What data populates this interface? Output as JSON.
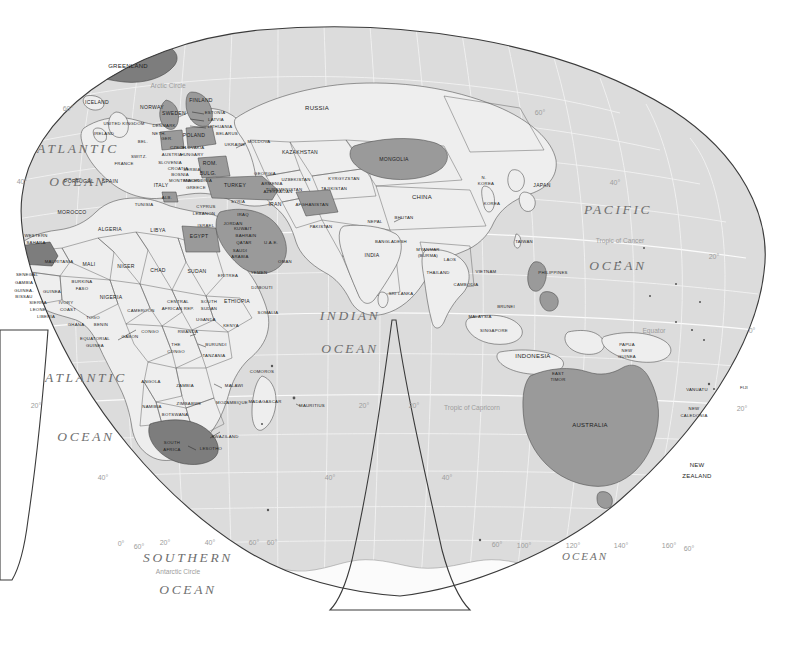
{
  "map": {
    "title": "World Map — Eastern Hemisphere (interrupted projection)",
    "projection": "interrupted-homolosine",
    "colors": {
      "background": "#ffffff",
      "ocean": "#dcdcdc",
      "land": "#eeeeee",
      "highlight_light": "#b9b9b9",
      "highlight_mid": "#9a9a9a",
      "highlight_dark": "#7d7d7d",
      "antarctica": "#fbfbfb",
      "border": "#555555",
      "graticule": "#f4f4f4",
      "frame": "#3a3a3a",
      "label_text": "#1d1d1d",
      "ocean_text": "#6f6f6f",
      "graticule_text": "#9c9c9c"
    }
  },
  "oceans": [
    {
      "id": "atlantic-north",
      "line1": "ATLANTIC",
      "line2": "OCEAN",
      "x": 78,
      "y1": 150,
      "y2": 183
    },
    {
      "id": "atlantic-south",
      "line1": "ATLANTIC",
      "line2": "OCEAN",
      "x": 86,
      "y1": 379,
      "y2": 438
    },
    {
      "id": "indian",
      "line1": "INDIAN",
      "line2": "OCEAN",
      "x": 350,
      "y1": 317,
      "y2": 350
    },
    {
      "id": "pacific",
      "line1": "PACIFIC",
      "line2": "OCEAN",
      "x": 618,
      "y1": 211,
      "y2": 267
    },
    {
      "id": "southern",
      "line1": "SOUTHERN",
      "line2": "OCEAN",
      "x": 188,
      "y1": 559,
      "y2": 591
    },
    {
      "id": "southern-east",
      "line1": "OCEAN",
      "line2": "",
      "x": 585,
      "y1": 557,
      "y2": 0
    }
  ],
  "reference_lines": [
    {
      "id": "arctic-circle",
      "label": "Arctic Circle",
      "x": 168,
      "y": 86
    },
    {
      "id": "tropic-of-cancer",
      "label": "Tropic of Cancer",
      "x": 620,
      "y": 241
    },
    {
      "id": "equator",
      "label": "Equator",
      "x": 654,
      "y": 331
    },
    {
      "id": "tropic-of-capricorn",
      "label": "Tropic of Capricorn",
      "x": 472,
      "y": 408
    },
    {
      "id": "antarctic-circle",
      "label": "Antarctic Circle",
      "x": 178,
      "y": 572
    }
  ],
  "graticule_labels": [
    {
      "id": "lat-60-nw",
      "label": "60°",
      "x": 68,
      "y": 109
    },
    {
      "id": "lat-40-nw",
      "label": "40°",
      "x": 22,
      "y": 182
    },
    {
      "id": "lat-60-ne",
      "label": "60°",
      "x": 540,
      "y": 113
    },
    {
      "id": "lat-40-ne",
      "label": "40°",
      "x": 615,
      "y": 183
    },
    {
      "id": "lat-20-ne",
      "label": "20°",
      "x": 714,
      "y": 257
    },
    {
      "id": "lat-0-e",
      "label": "0°",
      "x": 752,
      "y": 331
    },
    {
      "id": "lat-20-se",
      "label": "20°",
      "x": 742,
      "y": 409
    },
    {
      "id": "lat-20-sw",
      "label": "20°",
      "x": 36,
      "y": 406
    },
    {
      "id": "lat-20-gl",
      "label": "20°",
      "x": 364,
      "y": 406
    },
    {
      "id": "lat-20-gr",
      "label": "20°",
      "x": 414,
      "y": 406
    },
    {
      "id": "lat-40-sw",
      "label": "40°",
      "x": 103,
      "y": 478
    },
    {
      "id": "lat-40-gl",
      "label": "40°",
      "x": 330,
      "y": 478
    },
    {
      "id": "lat-40-gr",
      "label": "40°",
      "x": 447,
      "y": 478
    },
    {
      "id": "lat-60-sw",
      "label": "60°",
      "x": 139,
      "y": 547
    },
    {
      "id": "lat-60-gl",
      "label": "60°",
      "x": 272,
      "y": 543
    },
    {
      "id": "lat-60-gr",
      "label": "60°",
      "x": 497,
      "y": 545
    },
    {
      "id": "lat-60-sse",
      "label": "60°",
      "x": 689,
      "y": 549
    },
    {
      "id": "lon-0",
      "label": "0°",
      "x": 121,
      "y": 544
    },
    {
      "id": "lon-20e",
      "label": "20°",
      "x": 165,
      "y": 543
    },
    {
      "id": "lon-40e",
      "label": "40°",
      "x": 210,
      "y": 543
    },
    {
      "id": "lon-60e",
      "label": "60°",
      "x": 254,
      "y": 543
    },
    {
      "id": "lon-100e",
      "label": "100°",
      "x": 524,
      "y": 546
    },
    {
      "id": "lon-120e",
      "label": "120°",
      "x": 573,
      "y": 546
    },
    {
      "id": "lon-140e",
      "label": "140°",
      "x": 621,
      "y": 546
    },
    {
      "id": "lon-160e",
      "label": "160°",
      "x": 669,
      "y": 546
    }
  ],
  "countries": [
    {
      "name": "GREENLAND",
      "x": 128,
      "y": 66,
      "cls": "md"
    },
    {
      "name": "ICELAND",
      "x": 97,
      "y": 103
    },
    {
      "name": "NORWAY",
      "x": 152,
      "y": 108
    },
    {
      "name": "SWEDEN",
      "x": 174,
      "y": 114
    },
    {
      "name": "FINLAND",
      "x": 201,
      "y": 101
    },
    {
      "name": "ESTONIA",
      "x": 215,
      "y": 113,
      "cls": "sm"
    },
    {
      "name": "LATVIA",
      "x": 216,
      "y": 120,
      "cls": "sm"
    },
    {
      "name": "LITHUANIA",
      "x": 220,
      "y": 127,
      "cls": "sm"
    },
    {
      "name": "UNITED KINGDOM",
      "x": 124,
      "y": 124,
      "cls": "sm"
    },
    {
      "name": "IRELAND",
      "x": 104,
      "y": 134,
      "cls": "sm"
    },
    {
      "name": "DENMARK",
      "x": 164,
      "y": 126,
      "cls": "sm"
    },
    {
      "name": "NETH.",
      "x": 159,
      "y": 134,
      "cls": "sm"
    },
    {
      "name": "BEL.",
      "x": 143,
      "y": 142,
      "cls": "sm"
    },
    {
      "name": "GER.",
      "x": 167,
      "y": 139,
      "cls": "sm"
    },
    {
      "name": "POLAND",
      "x": 194,
      "y": 136
    },
    {
      "name": "BELARUS",
      "x": 227,
      "y": 134,
      "cls": "sm"
    },
    {
      "name": "UKRAINE",
      "x": 235,
      "y": 145,
      "cls": "sm"
    },
    {
      "name": "MOLDOVA",
      "x": 259,
      "y": 142,
      "cls": "sm"
    },
    {
      "name": "CZECH",
      "x": 178,
      "y": 148,
      "cls": "sm"
    },
    {
      "name": "SLOVAKIA",
      "x": 193,
      "y": 148,
      "cls": "sm"
    },
    {
      "name": "AUSTRIA",
      "x": 172,
      "y": 155,
      "cls": "sm"
    },
    {
      "name": "HUNGARY",
      "x": 192,
      "y": 155,
      "cls": "sm"
    },
    {
      "name": "SWITZ.",
      "x": 139,
      "y": 157,
      "cls": "sm"
    },
    {
      "name": "FRANCE",
      "x": 124,
      "y": 164,
      "cls": "sm"
    },
    {
      "name": "SLOVENIA",
      "x": 170,
      "y": 163,
      "cls": "sm"
    },
    {
      "name": "CROATIA",
      "x": 178,
      "y": 169,
      "cls": "sm"
    },
    {
      "name": "BOSNIA",
      "x": 180,
      "y": 175,
      "cls": "sm"
    },
    {
      "name": "SERBIA",
      "x": 192,
      "y": 170,
      "cls": "sm"
    },
    {
      "name": "MONTENEGRO",
      "x": 186,
      "y": 181,
      "cls": "sm"
    },
    {
      "name": "MACEDONIA",
      "x": 198,
      "y": 181,
      "cls": "sm"
    },
    {
      "name": "ROM.",
      "x": 210,
      "y": 164
    },
    {
      "name": "BULG.",
      "x": 208,
      "y": 174
    },
    {
      "name": "PORTUGAL",
      "x": 79,
      "y": 182
    },
    {
      "name": "SPAIN",
      "x": 110,
      "y": 182
    },
    {
      "name": "ITALY",
      "x": 161,
      "y": 186
    },
    {
      "name": "GREECE",
      "x": 196,
      "y": 188,
      "cls": "sm"
    },
    {
      "name": "ALB.",
      "x": 167,
      "y": 198,
      "cls": "sm"
    },
    {
      "name": "TURKEY",
      "x": 235,
      "y": 186
    },
    {
      "name": "GEORGIA",
      "x": 265,
      "y": 174,
      "cls": "sm"
    },
    {
      "name": "ARMENIA",
      "x": 272,
      "y": 184,
      "cls": "sm"
    },
    {
      "name": "AZERBAIJAN",
      "x": 278,
      "y": 192,
      "cls": "sm"
    },
    {
      "name": "CYPRUS",
      "x": 206,
      "y": 207,
      "cls": "sm"
    },
    {
      "name": "LEBANON",
      "x": 204,
      "y": 214,
      "cls": "sm"
    },
    {
      "name": "SYRIA",
      "x": 238,
      "y": 202,
      "cls": "sm"
    },
    {
      "name": "IRAQ",
      "x": 243,
      "y": 215,
      "cls": "sm"
    },
    {
      "name": "ISRAEL",
      "x": 206,
      "y": 226,
      "cls": "sm"
    },
    {
      "name": "JORDAN",
      "x": 233,
      "y": 224,
      "cls": "sm"
    },
    {
      "name": "KUWAIT",
      "x": 243,
      "y": 229,
      "cls": "sm"
    },
    {
      "name": "BAHRAIN",
      "x": 246,
      "y": 236,
      "cls": "sm"
    },
    {
      "name": "QATAR",
      "x": 244,
      "y": 243,
      "cls": "sm"
    },
    {
      "name": "U.A.E.",
      "x": 271,
      "y": 243,
      "cls": "sm"
    },
    {
      "name": "SAUDI",
      "x": 240,
      "y": 251,
      "cls": "sm"
    },
    {
      "name": "ARABIA",
      "x": 240,
      "y": 257,
      "cls": "sm"
    },
    {
      "name": "OMAN",
      "x": 285,
      "y": 262,
      "cls": "sm"
    },
    {
      "name": "YEMEN",
      "x": 259,
      "y": 273,
      "cls": "sm"
    },
    {
      "name": "DJIBOUTI",
      "x": 262,
      "y": 288,
      "cls": "sm"
    },
    {
      "name": "RUSSIA",
      "x": 317,
      "y": 108,
      "cls": "md"
    },
    {
      "name": "KAZAKHSTAN",
      "x": 300,
      "y": 153
    },
    {
      "name": "UZBEKISTAN",
      "x": 296,
      "y": 180,
      "cls": "sm"
    },
    {
      "name": "TURKMENISTAN",
      "x": 284,
      "y": 190,
      "cls": "sm"
    },
    {
      "name": "KYRGYZSTAN",
      "x": 344,
      "y": 179,
      "cls": "sm"
    },
    {
      "name": "TAJIKISTAN",
      "x": 334,
      "y": 189,
      "cls": "sm"
    },
    {
      "name": "IRAN",
      "x": 275,
      "y": 205
    },
    {
      "name": "AFGHANISTAN",
      "x": 312,
      "y": 205,
      "cls": "sm"
    },
    {
      "name": "PAKISTAN",
      "x": 321,
      "y": 227,
      "cls": "sm"
    },
    {
      "name": "MONGOLIA",
      "x": 394,
      "y": 160
    },
    {
      "name": "CHINA",
      "x": 422,
      "y": 197,
      "cls": "md"
    },
    {
      "name": "N.",
      "x": 484,
      "y": 178,
      "cls": "sm"
    },
    {
      "name": "KOREA",
      "x": 486,
      "y": 184,
      "cls": "sm"
    },
    {
      "name": "KOREA",
      "x": 492,
      "y": 204,
      "cls": "sm"
    },
    {
      "name": "JAPAN",
      "x": 542,
      "y": 186
    },
    {
      "name": "NEPAL",
      "x": 375,
      "y": 222,
      "cls": "sm"
    },
    {
      "name": "BHUTAN",
      "x": 404,
      "y": 218,
      "cls": "sm"
    },
    {
      "name": "BANGLADESH",
      "x": 391,
      "y": 242,
      "cls": "sm"
    },
    {
      "name": "INDIA",
      "x": 372,
      "y": 256
    },
    {
      "name": "MYANMAR",
      "x": 428,
      "y": 250,
      "cls": "sm"
    },
    {
      "name": "(BURMA)",
      "x": 428,
      "y": 256,
      "cls": "sm"
    },
    {
      "name": "LAOS",
      "x": 450,
      "y": 260,
      "cls": "sm"
    },
    {
      "name": "THAILAND",
      "x": 438,
      "y": 273,
      "cls": "sm"
    },
    {
      "name": "VIETNAM",
      "x": 486,
      "y": 272,
      "cls": "sm"
    },
    {
      "name": "CAMBODIA",
      "x": 466,
      "y": 285,
      "cls": "sm"
    },
    {
      "name": "SRI LANKA",
      "x": 401,
      "y": 294,
      "cls": "sm"
    },
    {
      "name": "TAIWAN",
      "x": 524,
      "y": 242,
      "cls": "sm"
    },
    {
      "name": "PHILIPPINES",
      "x": 553,
      "y": 273,
      "cls": "sm"
    },
    {
      "name": "BRUNEI",
      "x": 506,
      "y": 307,
      "cls": "sm"
    },
    {
      "name": "MALAYSIA",
      "x": 480,
      "y": 317,
      "cls": "sm"
    },
    {
      "name": "SINGAPORE",
      "x": 494,
      "y": 331,
      "cls": "sm"
    },
    {
      "name": "INDONESIA",
      "x": 533,
      "y": 356,
      "cls": "md"
    },
    {
      "name": "EAST",
      "x": 558,
      "y": 374,
      "cls": "sm"
    },
    {
      "name": "TIMOR",
      "x": 558,
      "y": 380,
      "cls": "sm"
    },
    {
      "name": "PAPUA",
      "x": 627,
      "y": 345,
      "cls": "sm"
    },
    {
      "name": "NEW",
      "x": 627,
      "y": 351,
      "cls": "sm"
    },
    {
      "name": "GUINEA",
      "x": 627,
      "y": 357,
      "cls": "sm"
    },
    {
      "name": "AUSTRALIA",
      "x": 590,
      "y": 425,
      "cls": "md"
    },
    {
      "name": "VANUATU",
      "x": 697,
      "y": 390,
      "cls": "sm"
    },
    {
      "name": "FIJI",
      "x": 744,
      "y": 388,
      "cls": "sm"
    },
    {
      "name": "NEW",
      "x": 694,
      "y": 409,
      "cls": "sm"
    },
    {
      "name": "CALEDONIA",
      "x": 694,
      "y": 416,
      "cls": "sm"
    },
    {
      "name": "NEW",
      "x": 697,
      "y": 465,
      "cls": "md"
    },
    {
      "name": "ZEALAND",
      "x": 697,
      "y": 476,
      "cls": "md"
    },
    {
      "name": "MOROCCO",
      "x": 72,
      "y": 213
    },
    {
      "name": "ALGERIA",
      "x": 110,
      "y": 230
    },
    {
      "name": "TUNISIA",
      "x": 144,
      "y": 205,
      "cls": "sm"
    },
    {
      "name": "LIBYA",
      "x": 158,
      "y": 231
    },
    {
      "name": "EGYPT",
      "x": 199,
      "y": 237
    },
    {
      "name": "WESTERN",
      "x": 36,
      "y": 236,
      "cls": "sm"
    },
    {
      "name": "SAHARA",
      "x": 36,
      "y": 243,
      "cls": "sm"
    },
    {
      "name": "MAURITANIA",
      "x": 59,
      "y": 262,
      "cls": "sm"
    },
    {
      "name": "MALI",
      "x": 89,
      "y": 265
    },
    {
      "name": "NIGER",
      "x": 126,
      "y": 267
    },
    {
      "name": "CHAD",
      "x": 158,
      "y": 271
    },
    {
      "name": "SUDAN",
      "x": 197,
      "y": 272
    },
    {
      "name": "ERITREA",
      "x": 228,
      "y": 276,
      "cls": "sm"
    },
    {
      "name": "SENEGAL",
      "x": 27,
      "y": 275,
      "cls": "sm"
    },
    {
      "name": "GAMBIA",
      "x": 24,
      "y": 283,
      "cls": "sm"
    },
    {
      "name": "GUINEA-",
      "x": 24,
      "y": 291,
      "cls": "sm"
    },
    {
      "name": "BISSAU",
      "x": 24,
      "y": 297,
      "cls": "sm"
    },
    {
      "name": "GUINEA",
      "x": 52,
      "y": 292,
      "cls": "sm"
    },
    {
      "name": "BURKINA",
      "x": 82,
      "y": 282,
      "cls": "sm"
    },
    {
      "name": "FASO",
      "x": 82,
      "y": 289,
      "cls": "sm"
    },
    {
      "name": "SIERRA",
      "x": 38,
      "y": 303,
      "cls": "sm"
    },
    {
      "name": "LEONE",
      "x": 38,
      "y": 310,
      "cls": "sm"
    },
    {
      "name": "LIBERIA",
      "x": 46,
      "y": 317,
      "cls": "sm"
    },
    {
      "name": "IVORY",
      "x": 66,
      "y": 303,
      "cls": "sm"
    },
    {
      "name": "COAST",
      "x": 68,
      "y": 310,
      "cls": "sm"
    },
    {
      "name": "GHANA",
      "x": 76,
      "y": 325,
      "cls": "sm"
    },
    {
      "name": "TOGO",
      "x": 93,
      "y": 318,
      "cls": "sm"
    },
    {
      "name": "BENIN",
      "x": 101,
      "y": 325,
      "cls": "sm"
    },
    {
      "name": "NIGERIA",
      "x": 111,
      "y": 298
    },
    {
      "name": "CAMEROON",
      "x": 141,
      "y": 311,
      "cls": "sm"
    },
    {
      "name": "CENTRAL",
      "x": 178,
      "y": 302,
      "cls": "sm"
    },
    {
      "name": "AFRICAN REP.",
      "x": 178,
      "y": 309,
      "cls": "sm"
    },
    {
      "name": "SOUTH",
      "x": 209,
      "y": 302,
      "cls": "sm"
    },
    {
      "name": "SUDAN",
      "x": 209,
      "y": 309,
      "cls": "sm"
    },
    {
      "name": "ETHIOPIA",
      "x": 237,
      "y": 302
    },
    {
      "name": "SOMALIA",
      "x": 268,
      "y": 313,
      "cls": "sm"
    },
    {
      "name": "EQUATORIAL",
      "x": 95,
      "y": 339,
      "cls": "sm"
    },
    {
      "name": "GUINEA",
      "x": 95,
      "y": 346,
      "cls": "sm"
    },
    {
      "name": "GABON",
      "x": 130,
      "y": 337,
      "cls": "sm"
    },
    {
      "name": "CONGO",
      "x": 150,
      "y": 332,
      "cls": "sm"
    },
    {
      "name": "THE",
      "x": 176,
      "y": 345,
      "cls": "sm"
    },
    {
      "name": "CONGO",
      "x": 176,
      "y": 352,
      "cls": "sm"
    },
    {
      "name": "UGANDA",
      "x": 206,
      "y": 320,
      "cls": "sm"
    },
    {
      "name": "RWANDA",
      "x": 188,
      "y": 332,
      "cls": "sm"
    },
    {
      "name": "KENYA",
      "x": 231,
      "y": 326,
      "cls": "sm"
    },
    {
      "name": "BURUNDI",
      "x": 216,
      "y": 345,
      "cls": "sm"
    },
    {
      "name": "TANZANIA",
      "x": 214,
      "y": 356,
      "cls": "sm"
    },
    {
      "name": "ANGOLA",
      "x": 151,
      "y": 382,
      "cls": "sm"
    },
    {
      "name": "ZAMBIA",
      "x": 185,
      "y": 386,
      "cls": "sm"
    },
    {
      "name": "MALAWI",
      "x": 234,
      "y": 386,
      "cls": "sm"
    },
    {
      "name": "ZIMBABWE",
      "x": 189,
      "y": 404,
      "cls": "sm"
    },
    {
      "name": "MOZAMBIQUE",
      "x": 232,
      "y": 403,
      "cls": "sm"
    },
    {
      "name": "MADAGASCAR",
      "x": 265,
      "y": 402,
      "cls": "sm"
    },
    {
      "name": "NAMIBIA",
      "x": 152,
      "y": 407,
      "cls": "sm"
    },
    {
      "name": "BOTSWANA",
      "x": 175,
      "y": 415,
      "cls": "sm"
    },
    {
      "name": "SOUTH",
      "x": 172,
      "y": 443,
      "cls": "sm"
    },
    {
      "name": "AFRICA",
      "x": 172,
      "y": 450,
      "cls": "sm"
    },
    {
      "name": "SWAZILAND",
      "x": 225,
      "y": 437,
      "cls": "sm"
    },
    {
      "name": "LESOTHO",
      "x": 211,
      "y": 449,
      "cls": "sm"
    },
    {
      "name": "COMOROS",
      "x": 262,
      "y": 372,
      "cls": "sm"
    },
    {
      "name": "MAURITIUS",
      "x": 312,
      "y": 406,
      "cls": "sm"
    }
  ],
  "highlighted_countries": [
    "Greenland",
    "Finland",
    "Sweden",
    "Poland",
    "Germany",
    "Romania",
    "Bulgaria",
    "Turkey",
    "Armenia",
    "Azerbaijan",
    "Syria",
    "Iraq",
    "Israel",
    "Jordan",
    "Saudi Arabia",
    "Egypt",
    "Western Sahara",
    "Mongolia",
    "Afghanistan",
    "Philippines",
    "Australia",
    "South Africa",
    "Albania",
    "Greece"
  ]
}
